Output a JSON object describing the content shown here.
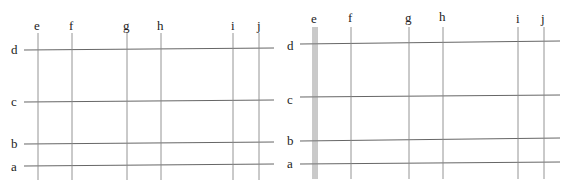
{
  "panels": [
    {
      "name": "left-grid",
      "row_labels": [
        "d",
        "c",
        "b",
        "a"
      ],
      "column_labels": [
        "e",
        "f",
        "g",
        "h",
        "i",
        "j"
      ],
      "e_line_style": "single"
    },
    {
      "name": "right-grid",
      "row_labels": [
        "d",
        "c",
        "b",
        "a"
      ],
      "column_labels": [
        "e",
        "f",
        "g",
        "h",
        "i",
        "j"
      ],
      "e_line_style": "triple"
    }
  ]
}
